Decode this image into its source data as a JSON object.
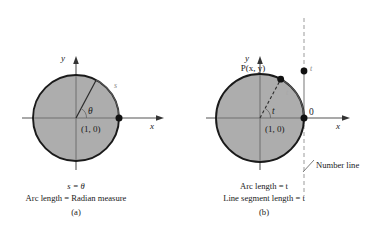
{
  "figure": {
    "title_semantics": "unit-circle-radian-measure-and-number-line-wrapping",
    "panels": [
      {
        "id": "a",
        "panel_label": "(a)",
        "axis_x_label": "x",
        "axis_y_label": "y",
        "point_label": "(1, 0)",
        "arc_label": "s",
        "angle_label": "θ",
        "caption_line1": "s = θ",
        "caption_line2": "Arc length = Radian measure",
        "circle": {
          "cx": 76,
          "cy": 118,
          "r": 43
        },
        "terminal_angle_deg": 62
      },
      {
        "id": "b",
        "panel_label": "(b)",
        "axis_x_label": "x",
        "axis_y_label": "y",
        "point_label": "(1, 0)",
        "moving_point_label": "P(x, y)",
        "arc_label": "t",
        "angle_label": "t",
        "number_line_zero_label": "0",
        "number_line_t_label": "t",
        "number_line_label": "Number line",
        "caption_line1": "Arc length = t",
        "caption_line2": "Line segment length = t",
        "circle": {
          "cx": 260,
          "cy": 118,
          "r": 44
        },
        "terminal_angle_deg": 62
      }
    ],
    "colors": {
      "disk_fill": "#a9a9a9",
      "circle_stroke": "#1a1a1a",
      "axis_stroke": "#3a3a3a",
      "number_line_stroke": "#9a9a9a",
      "text": "#1a1a1a",
      "background": "#ffffff"
    }
  }
}
